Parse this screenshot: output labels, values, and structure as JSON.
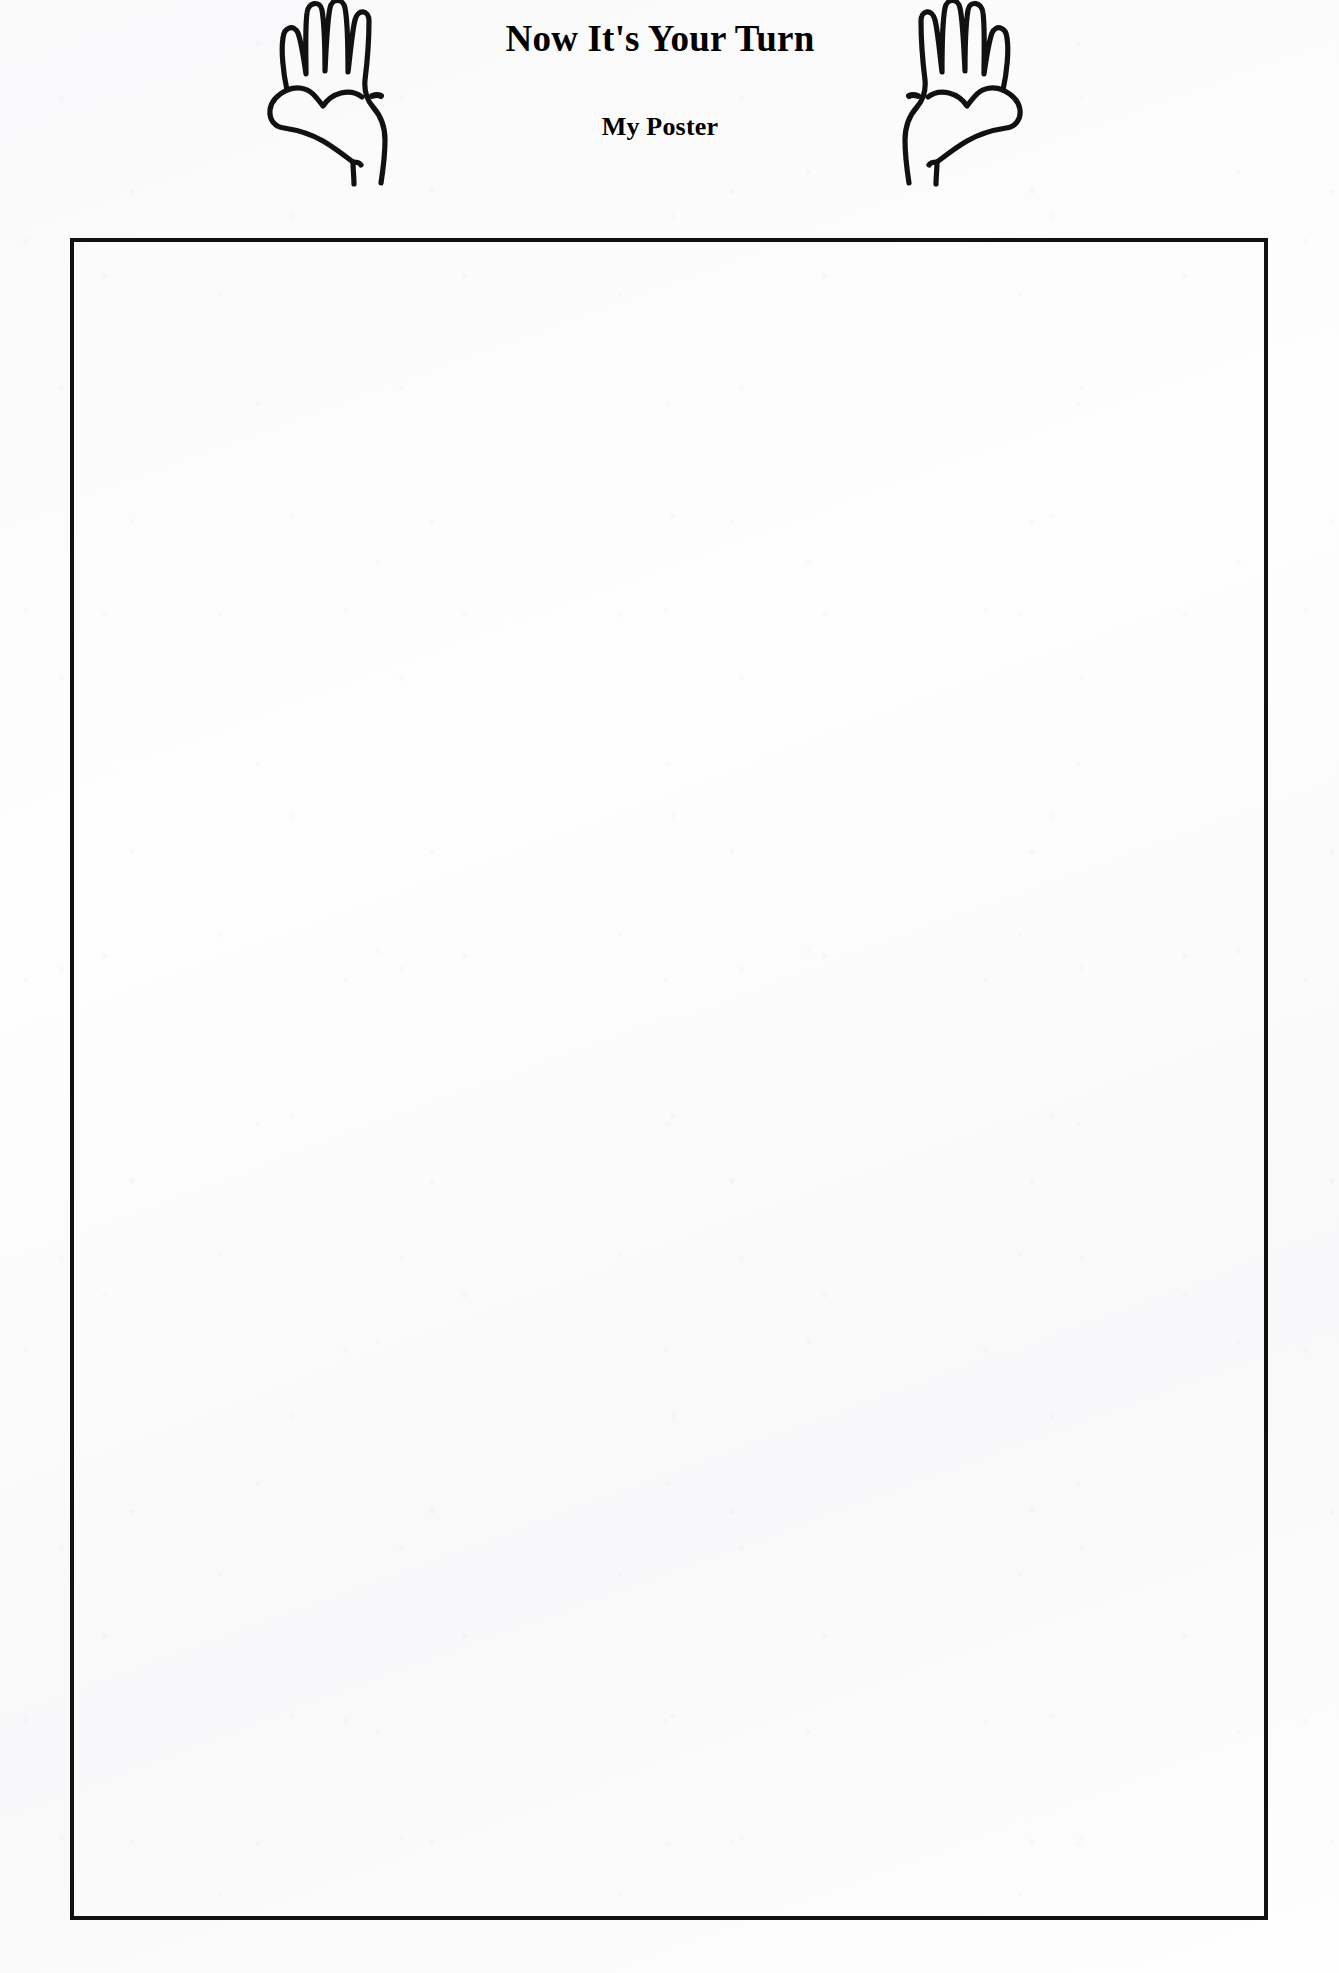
{
  "document": {
    "kind": "worksheet-page",
    "background_color": "#fefefe",
    "ink_color": "#111111"
  },
  "header": {
    "title": "Now It's Your Turn",
    "subtitle": "My Poster",
    "left_hand_icon": "open-hand-left-icon",
    "right_hand_icon": "open-hand-right-icon"
  },
  "poster": {
    "area_label": "",
    "content": ""
  }
}
